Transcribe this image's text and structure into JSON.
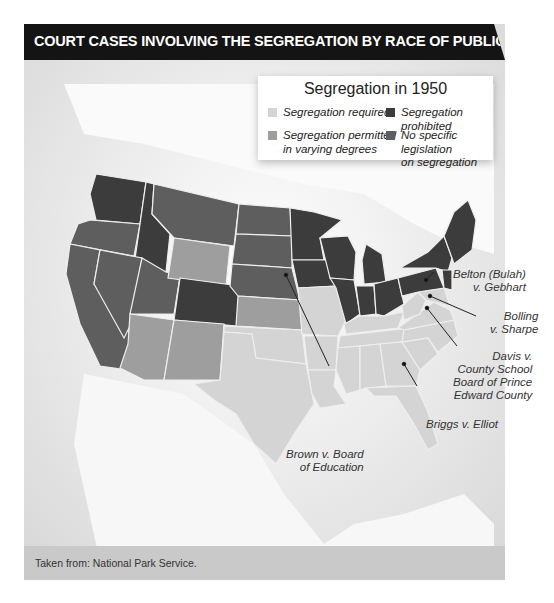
{
  "title": "COURT CASES INVOLVING THE SEGREGATION BY RACE OF PUBLIC SCHOOLS",
  "legend": {
    "title": "Segregation in 1950",
    "items": [
      {
        "label_line1": "Segregation required",
        "label_line2": "",
        "color": "#d4d4d4"
      },
      {
        "label_line1": "Segregation  prohibited",
        "label_line2": "",
        "color": "#3c3c3c"
      },
      {
        "label_line1": "Segregation  permitted",
        "label_line2": "in varying degrees",
        "color": "#9e9e9e"
      },
      {
        "label_line1": "No specific legislation",
        "label_line2": "on segregation",
        "color": "#5e5e5e"
      }
    ]
  },
  "callouts": [
    {
      "line1": "Belton (Bulah)",
      "line2": "v. Gebhart",
      "line3": "",
      "line4": ""
    },
    {
      "line1": "Bolling",
      "line2": "v. Sharpe",
      "line3": "",
      "line4": ""
    },
    {
      "line1": "Davis v.",
      "line2": "County School",
      "line3": "Board of Prince",
      "line4": "Edward County"
    },
    {
      "line1": "Briggs v. Elliot",
      "line2": "",
      "line3": "",
      "line4": ""
    },
    {
      "line1": "Brown v. Board",
      "line2": "of Education",
      "line3": "",
      "line4": ""
    }
  ],
  "footer": {
    "source": "Taken from: National Park Service."
  },
  "map_data": {
    "categories": {
      "required": [
        "Texas",
        "Oklahoma",
        "Missouri",
        "Arkansas",
        "Louisiana",
        "Mississippi",
        "Alabama",
        "Tennessee",
        "Kentucky",
        "Georgia",
        "Florida",
        "South Carolina",
        "North Carolina",
        "Virginia",
        "West Virginia",
        "Maryland",
        "Delaware"
      ],
      "permitted": [
        "Wyoming",
        "Kansas",
        "Arizona",
        "New Mexico"
      ],
      "prohibited": [
        "Washington",
        "Idaho",
        "Colorado",
        "Minnesota",
        "Iowa",
        "Wisconsin",
        "Illinois",
        "Indiana",
        "Michigan",
        "Ohio",
        "Pennsylvania",
        "New York",
        "New Jersey",
        "Connecticut",
        "Rhode Island",
        "Massachusetts",
        "Vermont",
        "New Hampshire",
        "Maine"
      ],
      "no_legislation": [
        "Oregon",
        "California",
        "Nevada",
        "Utah",
        "Montana",
        "North Dakota",
        "South Dakota",
        "Nebraska"
      ]
    }
  }
}
